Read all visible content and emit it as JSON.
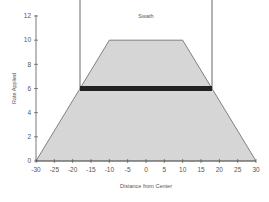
{
  "chart_data": {
    "type": "area",
    "title": "",
    "xlabel": "Distance from Center",
    "ylabel": "Rate Applied",
    "xlim": [
      -30,
      30
    ],
    "ylim": [
      0,
      12
    ],
    "x_ticks": [
      -30,
      -25,
      -20,
      -15,
      -10,
      -5,
      0,
      5,
      10,
      15,
      20,
      25,
      30
    ],
    "y_ticks": [
      0,
      2,
      4,
      6,
      8,
      10,
      12
    ],
    "grid": false,
    "legend": null,
    "series": [
      {
        "name": "Application Rate Profile",
        "x": [
          -30,
          -10,
          10,
          30
        ],
        "y": [
          0,
          10,
          10,
          0
        ],
        "fill": "#d6d6d6",
        "stroke": "#666666"
      }
    ],
    "annotations": [
      {
        "type": "band",
        "label": "Effective rate",
        "x_start": -18,
        "x_end": 18,
        "y": 6,
        "color": "#222222"
      },
      {
        "type": "vline",
        "x": -18,
        "y_from": 6,
        "y_to": 13.3,
        "color": "#555555"
      },
      {
        "type": "vline",
        "x": 18,
        "y_from": 6,
        "y_to": 13.3,
        "color": "#555555"
      },
      {
        "type": "text",
        "text": "Swath",
        "x": 0,
        "y": 12
      }
    ]
  },
  "labels": {
    "swath": "Swath",
    "xlabel": "Distance from Center",
    "ylabel": "Rate Applied"
  }
}
